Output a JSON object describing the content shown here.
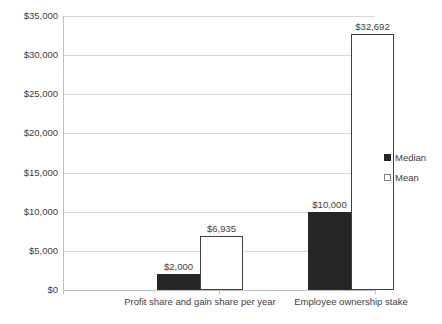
{
  "chart_data": {
    "type": "bar",
    "title": "",
    "subtitle": "",
    "xlabel": "",
    "ylabel": "",
    "ylim": [
      0,
      35000
    ],
    "grid": true,
    "legend_position": "right",
    "categories": [
      "Profit share and gain share per year",
      "Employee ownership stake"
    ],
    "series": [
      {
        "name": "Median",
        "color": "#262626",
        "values": [
          2000,
          10000
        ],
        "labels": [
          "$2,000",
          "$10,000"
        ]
      },
      {
        "name": "Mean",
        "color": "#ffffff",
        "values": [
          6935,
          32692
        ],
        "labels": [
          "$6,935",
          "$32,692"
        ]
      }
    ],
    "y_ticks": [
      0,
      5000,
      10000,
      15000,
      20000,
      25000,
      30000,
      35000
    ],
    "y_tick_labels": [
      "$0",
      "$5,000",
      "$10,000",
      "$15,000",
      "$20,000",
      "$25,000",
      "$30,000",
      "$35,000"
    ]
  },
  "legend": {
    "items": [
      {
        "label": "Median",
        "marker": "filled-square-icon"
      },
      {
        "label": "Mean",
        "marker": "hollow-square-icon"
      }
    ]
  },
  "colors": {
    "median": "#262626",
    "mean": "#ffffff",
    "mean_outline": "#404040",
    "gridline": "#d9d9d9",
    "axis": "#bfbfbf",
    "text": "#404040",
    "background": "#ffffff"
  }
}
